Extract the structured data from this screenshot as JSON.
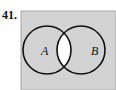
{
  "problem_number": "41.",
  "diagram": {
    "type": "venn",
    "sets": [
      {
        "label": "A"
      },
      {
        "label": "B"
      }
    ],
    "shaded_region": "complement of A ∩ B (everything except the intersection)",
    "colors": {
      "shade": "#d3d3d3",
      "unshaded": "#ffffff",
      "stroke": "#111111"
    }
  }
}
